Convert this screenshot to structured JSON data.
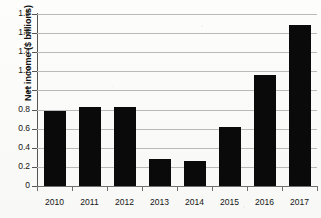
{
  "chart_data": {
    "type": "bar",
    "title": "",
    "subtitle": "",
    "xlabel": "",
    "ylabel": "Net income ($ billions)",
    "categories": [
      "2010",
      "2011",
      "2012",
      "2013",
      "2014",
      "2015",
      "2016",
      "2017"
    ],
    "values": [
      0.78,
      0.83,
      0.825,
      0.28,
      0.26,
      0.62,
      1.16,
      1.68
    ],
    "series": [
      {
        "name": "Net income",
        "values": [
          0.78,
          0.83,
          0.825,
          0.28,
          0.26,
          0.62,
          1.16,
          1.68
        ]
      }
    ],
    "ylim": [
      0,
      1.8
    ],
    "ytick_values": [
      0,
      0.2,
      0.4,
      0.6,
      0.8,
      1.0,
      1.2,
      1.4,
      1.6,
      1.8
    ],
    "ytick_labels": [
      "0",
      "0.2",
      "0.4",
      "0.6",
      "0.8",
      "1",
      "1.2",
      "1.4",
      "1.6",
      "1.8"
    ],
    "grid": true,
    "grid_axis": "y",
    "legend": false,
    "legend_position": "none",
    "bar_color": "#0a0a0a",
    "gridline_color": "#b9b9b9",
    "axis_color": "#6f6f6f",
    "background_color": "#fbfbfa",
    "annotations": []
  }
}
